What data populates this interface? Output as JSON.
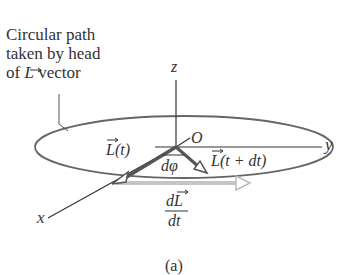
{
  "caption": {
    "line1": "Circular path",
    "line2": "taken by head",
    "line3_prefix": "of ",
    "line3_symbol": "L",
    "line3_suffix": " vector"
  },
  "axes": {
    "z": "z",
    "y": "y",
    "x": "x",
    "origin": "O"
  },
  "vectors": {
    "L_t": "L(t)",
    "L_t_dt": "L(t + dt)",
    "dphi": "dφ",
    "dL_num": "dL",
    "dL_den": "dt"
  },
  "figure_label": "(a)",
  "colors": {
    "ink": "#333333",
    "vector": "#555555",
    "dL_vector": "#bbbbbb",
    "ellipse": "#666666"
  }
}
